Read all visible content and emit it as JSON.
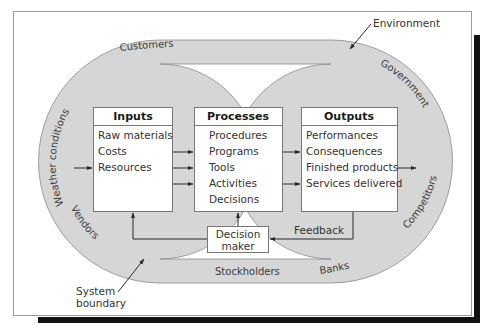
{
  "diagram": {
    "type": "systems-model",
    "colors": {
      "band_fill": "#d6d6d6",
      "band_stroke": "#8a8a8a",
      "frame_stroke": "#9a9a9a",
      "shadow": "#111111",
      "box_stroke": "#777777",
      "arrow": "#2a2a2a"
    },
    "callouts": {
      "environment": "Environment",
      "system_boundary_line1": "System",
      "system_boundary_line2": "boundary"
    },
    "environment_factors": {
      "customers": "Customers",
      "weather": "Weather conditions",
      "government": "Government",
      "competitors": "Competitors",
      "banks": "Banks",
      "stockholders": "Stockholders",
      "vendors": "Vendors"
    },
    "boxes": {
      "inputs": {
        "title": "Inputs",
        "items": [
          "Raw materials",
          "Costs",
          "Resources"
        ]
      },
      "processes": {
        "title": "Processes",
        "items": [
          "Procedures",
          "Programs",
          "Tools",
          "Activities",
          "Decisions"
        ]
      },
      "outputs": {
        "title": "Outputs",
        "items": [
          "Performances",
          "Consequences",
          "Finished products",
          "Services delivered"
        ]
      },
      "decision_maker": {
        "line1": "Decision",
        "line2": "maker"
      }
    },
    "feedback_label": "Feedback"
  }
}
